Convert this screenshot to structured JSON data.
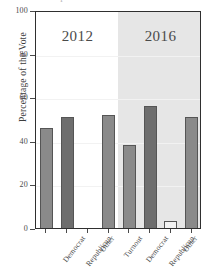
{
  "figure": {
    "title_sliver": "Comparison of 2012 and 2016 Presidential Election Results",
    "ylabel": "Percentage of the Vote"
  },
  "axis": {
    "y_ticks": [
      0,
      20,
      40,
      60,
      80,
      100
    ],
    "y_tick_labels": [
      "0",
      "20",
      "40",
      "60",
      "80",
      "100"
    ],
    "ylim": [
      0,
      100
    ]
  },
  "groups": [
    {
      "label": "2012",
      "shaded": false
    },
    {
      "label": "2016",
      "shaded": true
    }
  ],
  "colors": {
    "democrat": "#8a8a8a",
    "republican": "#6e6e6e",
    "other": "#f2f2f2",
    "turnout": "#8a8a8a",
    "bar_edge": "#555555",
    "panel_shade": "#e6e6e6",
    "axis": "#2f2f2f",
    "grid": "#f2f2f2",
    "text": "#4a4a4a"
  },
  "chart_data": {
    "type": "bar",
    "title": "Comparison of 2012 and 2016 Presidential Election Results",
    "xlabel": "",
    "ylabel": "Percentage of the Vote",
    "ylim": [
      0,
      100
    ],
    "yticks": [
      0,
      20,
      40,
      60,
      80,
      100
    ],
    "grid": true,
    "legend": false,
    "grouped": true,
    "categories": [
      "Democrat",
      "Republican",
      "Other",
      "Turnout"
    ],
    "groups": [
      "2012",
      "2016"
    ],
    "series": [
      {
        "name": "2012",
        "values": [
          47,
          52,
          1,
          53
        ]
      },
      {
        "name": "2016",
        "values": [
          39,
          57,
          4,
          52
        ]
      }
    ],
    "bars": [
      {
        "group": "2012",
        "category": "Democrat",
        "value": 47,
        "color": "#8a8a8a"
      },
      {
        "group": "2012",
        "category": "Republican",
        "value": 52,
        "color": "#6e6e6e"
      },
      {
        "group": "2012",
        "category": "Other",
        "value": 1,
        "color": "#f2f2f2"
      },
      {
        "group": "2012",
        "category": "Turnout",
        "value": 53,
        "color": "#8a8a8a"
      },
      {
        "group": "2016",
        "category": "Democrat",
        "value": 39,
        "color": "#8a8a8a"
      },
      {
        "group": "2016",
        "category": "Republican",
        "value": 57,
        "color": "#6e6e6e"
      },
      {
        "group": "2016",
        "category": "Other",
        "value": 4,
        "color": "#f2f2f2"
      },
      {
        "group": "2016",
        "category": "Turnout",
        "value": 52,
        "color": "#8a8a8a"
      }
    ]
  }
}
